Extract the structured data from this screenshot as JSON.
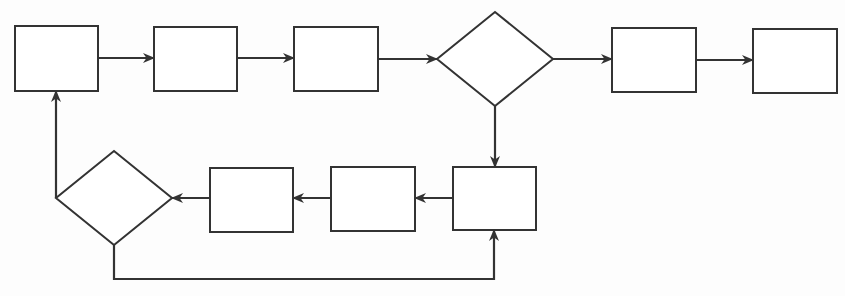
{
  "diagram": {
    "type": "flowchart",
    "canvas": {
      "width": 845,
      "height": 296,
      "background": "#fdfdfd"
    },
    "colors": {
      "stroke": "#333333",
      "fill": "#ffffff"
    },
    "nodes": [
      {
        "id": "n1",
        "shape": "rect",
        "label": "",
        "x": 15,
        "y": 26,
        "w": 83,
        "h": 65
      },
      {
        "id": "n2",
        "shape": "rect",
        "label": "",
        "x": 154,
        "y": 27,
        "w": 83,
        "h": 64
      },
      {
        "id": "n3",
        "shape": "rect",
        "label": "",
        "x": 294,
        "y": 27,
        "w": 84,
        "h": 64
      },
      {
        "id": "d1",
        "shape": "diamond",
        "label": "",
        "cx": 495,
        "cy": 59,
        "hw": 58,
        "hh": 47
      },
      {
        "id": "n4",
        "shape": "rect",
        "label": "",
        "x": 612,
        "y": 28,
        "w": 84,
        "h": 64
      },
      {
        "id": "n5",
        "shape": "rect",
        "label": "",
        "x": 753,
        "y": 29,
        "w": 84,
        "h": 64
      },
      {
        "id": "n6",
        "shape": "rect",
        "label": "",
        "x": 453,
        "y": 167,
        "w": 83,
        "h": 63
      },
      {
        "id": "n7",
        "shape": "rect",
        "label": "",
        "x": 331,
        "y": 167,
        "w": 84,
        "h": 64
      },
      {
        "id": "n8",
        "shape": "rect",
        "label": "",
        "x": 210,
        "y": 168,
        "w": 83,
        "h": 64
      },
      {
        "id": "d2",
        "shape": "diamond",
        "label": "",
        "cx": 114,
        "cy": 198,
        "hw": 58,
        "hh": 47
      }
    ],
    "edges": [
      {
        "id": "e1",
        "from": "n1",
        "to": "n2",
        "points": [
          [
            98,
            58
          ],
          [
            154,
            58
          ]
        ]
      },
      {
        "id": "e2",
        "from": "n2",
        "to": "n3",
        "points": [
          [
            237,
            58
          ],
          [
            294,
            58
          ]
        ]
      },
      {
        "id": "e3",
        "from": "n3",
        "to": "d1",
        "points": [
          [
            378,
            59
          ],
          [
            437,
            59
          ]
        ]
      },
      {
        "id": "e4",
        "from": "d1",
        "to": "n4",
        "points": [
          [
            553,
            59
          ],
          [
            612,
            59
          ]
        ]
      },
      {
        "id": "e5",
        "from": "n4",
        "to": "n5",
        "points": [
          [
            696,
            60
          ],
          [
            753,
            60
          ]
        ]
      },
      {
        "id": "e6",
        "from": "d1",
        "to": "n6",
        "points": [
          [
            495,
            106
          ],
          [
            495,
            167
          ]
        ]
      },
      {
        "id": "e7",
        "from": "n6",
        "to": "n7",
        "points": [
          [
            453,
            198
          ],
          [
            415,
            198
          ]
        ]
      },
      {
        "id": "e8",
        "from": "n7",
        "to": "n8",
        "points": [
          [
            331,
            198
          ],
          [
            293,
            198
          ]
        ]
      },
      {
        "id": "e9",
        "from": "n8",
        "to": "d2",
        "points": [
          [
            210,
            198
          ],
          [
            172,
            198
          ]
        ]
      },
      {
        "id": "e10",
        "from": "d2",
        "to": "n1",
        "points": [
          [
            56,
            198
          ],
          [
            56,
            91
          ]
        ]
      },
      {
        "id": "e11",
        "from": "d2",
        "to": "n6",
        "points": [
          [
            114,
            245
          ],
          [
            114,
            279
          ],
          [
            494,
            279
          ],
          [
            494,
            230
          ]
        ]
      }
    ]
  }
}
